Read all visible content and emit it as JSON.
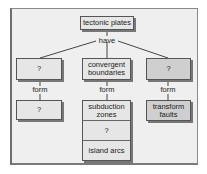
{
  "diagram": {
    "root": {
      "label": "tectonic plates"
    },
    "root_link": "have",
    "branches": [
      {
        "box": "?",
        "link": "form",
        "result": [
          "?"
        ]
      },
      {
        "box": "convergent boundaries",
        "link": "form",
        "result": [
          "subduction zones",
          "?",
          "island arcs"
        ]
      },
      {
        "box": "?",
        "link": "form",
        "result": [
          "transform faults"
        ]
      }
    ]
  },
  "colors": {
    "frame_bg": "#efefef",
    "box_fill": "#e6e6e6",
    "box_fill_dark": "#cfcfcf",
    "line": "#444444"
  }
}
